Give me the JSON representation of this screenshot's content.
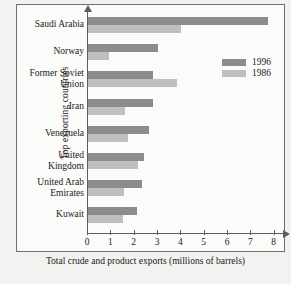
{
  "chart_data": {
    "type": "bar",
    "orientation": "horizontal",
    "title": "",
    "xlabel": "Total crude and product exports (millions of barrels)",
    "ylabel": "Top exporting countries",
    "categories": [
      "Saudi Arabia",
      "Norway",
      "Former Soviet Union",
      "Iran",
      "Venezuela",
      "United Kingdom",
      "United Arab Emirates",
      "Kuwait"
    ],
    "series": [
      {
        "name": "1996",
        "color": "#8c8c8c",
        "values": [
          7.7,
          3.0,
          2.8,
          2.8,
          2.6,
          2.4,
          2.3,
          2.1
        ]
      },
      {
        "name": "1986",
        "color": "#bfbfbf",
        "values": [
          4.0,
          0.9,
          3.8,
          1.6,
          1.7,
          2.15,
          1.55,
          1.5
        ]
      }
    ],
    "xlim": [
      0,
      8.4
    ],
    "xticks": [
      0,
      1,
      2,
      3,
      4,
      5,
      6,
      7,
      8
    ],
    "xtick_labels": [
      "0",
      "1",
      "2",
      "3",
      "4",
      "5",
      "6",
      "7",
      "8"
    ],
    "grid": false,
    "legend_position": "upper right"
  },
  "legend": {
    "entries": [
      {
        "label": "1996",
        "color": "#8c8c8c"
      },
      {
        "label": "1986",
        "color": "#bfbfbf"
      }
    ]
  },
  "caption": "",
  "colors": {
    "background": "#f2f2f0",
    "plot_background": "#fbfbfa",
    "frame": "#6f6f6f",
    "axis": "#5d5d5d",
    "text": "#1a1a1a"
  }
}
